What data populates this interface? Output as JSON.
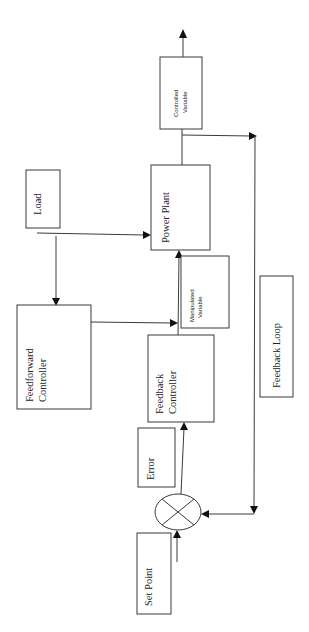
{
  "diagram": {
    "title": "",
    "orientation": "rotated-90-ccw",
    "blocks": {
      "set_point": {
        "label": "Set Point"
      },
      "error": {
        "label": "Error"
      },
      "feedback_controller": {
        "line1": "Feedback",
        "line2": "Controller"
      },
      "feedforward_controller": {
        "line1": "Feedforward",
        "line2": "Controller"
      },
      "load": {
        "label": "Load"
      },
      "manipulated_variable": {
        "line1": "Manipulated",
        "line2": "Variable"
      },
      "power_plant": {
        "label": "Power Plant"
      },
      "controlled_variable": {
        "line1": "Controlled",
        "line2": "Variable"
      },
      "feedback_loop": {
        "label": "Feedback Loop"
      }
    },
    "summing_junction": {
      "symbol": "circle-with-x"
    },
    "connections": [
      {
        "from": "set_point",
        "to": "summing_junction"
      },
      {
        "from": "summing_junction",
        "to": "feedback_controller"
      },
      {
        "from": "feedback_controller",
        "to": "power_plant"
      },
      {
        "from": "feedforward_controller",
        "to": "manipulated_variable"
      },
      {
        "from": "load",
        "to": "power_plant"
      },
      {
        "from": "load",
        "to": "feedforward_controller"
      },
      {
        "from": "power_plant",
        "to": "controlled_variable"
      },
      {
        "from": "controlled_variable",
        "to": "output"
      },
      {
        "from": "controlled_variable",
        "to": "feedback_loop"
      },
      {
        "from": "feedback_loop",
        "to": "summing_junction"
      }
    ],
    "colors": {
      "stroke": "#3a3a3a",
      "text": "#222222",
      "background": "#ffffff"
    }
  }
}
